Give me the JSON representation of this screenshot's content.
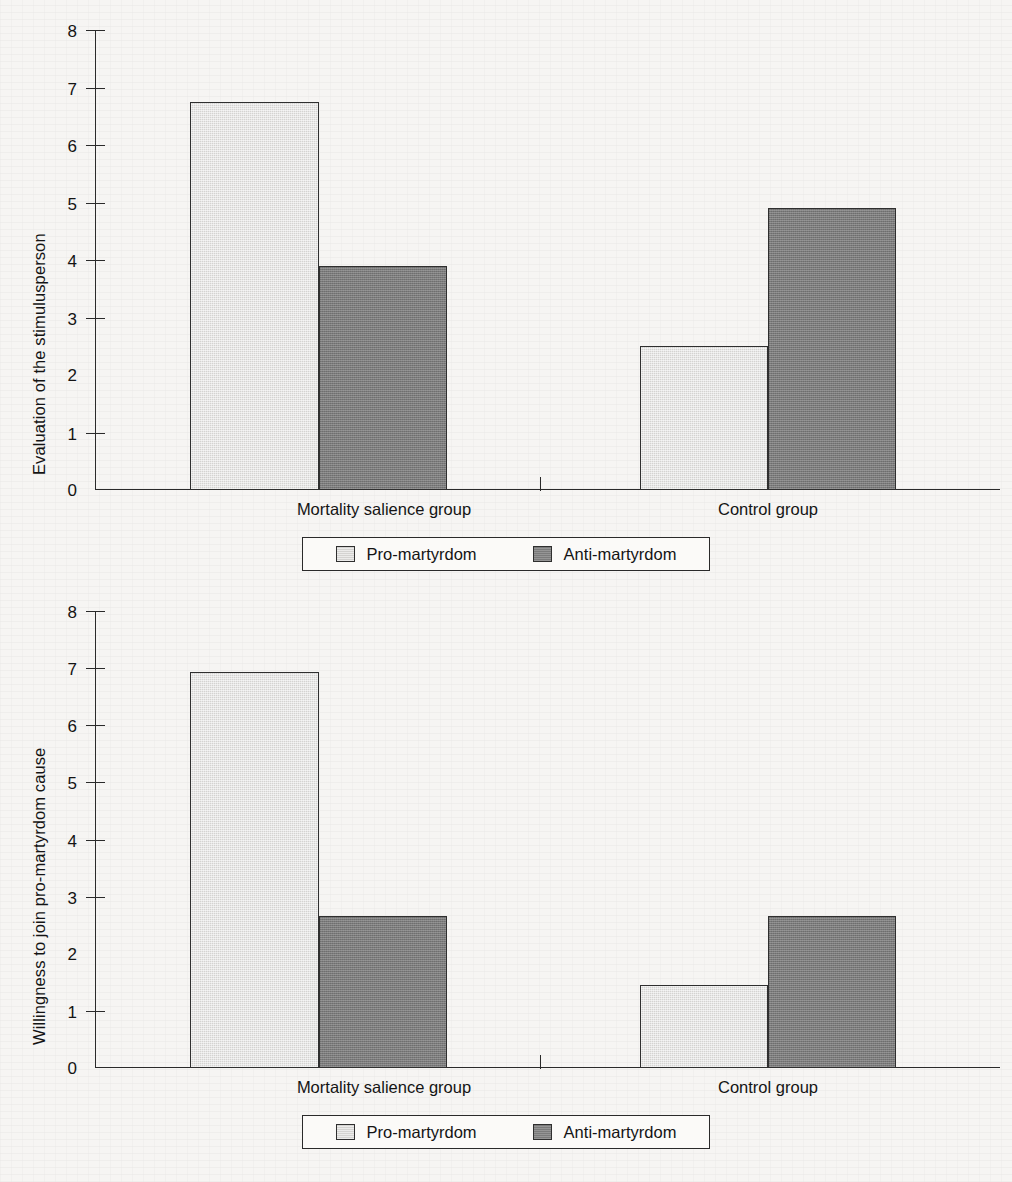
{
  "chart_data": [
    {
      "type": "bar",
      "title": "",
      "xlabel": "",
      "ylabel": "Evaluation of the stimulusperson",
      "categories": [
        "Mortality salience group",
        "Control group"
      ],
      "series": [
        {
          "name": "Pro-martyrdom",
          "values": [
            6.75,
            2.5
          ]
        },
        {
          "name": "Anti-martyrdom",
          "values": [
            3.9,
            4.9
          ]
        }
      ],
      "ylim": [
        0,
        8
      ],
      "yticks": [
        "8",
        "7",
        "6",
        "5",
        "4",
        "3",
        "2",
        "1",
        "0"
      ],
      "grid": false,
      "legend_position": "bottom"
    },
    {
      "type": "bar",
      "title": "",
      "xlabel": "",
      "ylabel": "Willingness to join pro-martyrdom cause",
      "categories": [
        "Mortality salience group",
        "Control group"
      ],
      "series": [
        {
          "name": "Pro-martyrdom",
          "values": [
            6.93,
            1.45
          ]
        },
        {
          "name": "Anti-martyrdom",
          "values": [
            2.67,
            2.67
          ]
        }
      ],
      "ylim": [
        0,
        8
      ],
      "yticks": [
        "8",
        "7",
        "6",
        "5",
        "4",
        "3",
        "2",
        "1",
        "0"
      ],
      "grid": false,
      "legend_position": "bottom"
    }
  ],
  "colors": {
    "pro_martyrdom": "#d4d3d1",
    "anti_martyrdom": "#7b7b7b",
    "axis": "#2a2a2a",
    "background": "#f6f5f3"
  },
  "top_chart": {
    "ylabel": "Evaluation of the stimulusperson",
    "yticks": [
      "8",
      "7",
      "6",
      "5",
      "4",
      "3",
      "2",
      "1",
      "0"
    ],
    "categories": [
      "Mortality salience group",
      "Control group"
    ],
    "legend": [
      {
        "label": "Pro-martyrdom"
      },
      {
        "label": "Anti-martyrdom"
      }
    ]
  },
  "bottom_chart": {
    "ylabel": "Willingness to join pro-martyrdom cause",
    "yticks": [
      "8",
      "7",
      "6",
      "5",
      "4",
      "3",
      "2",
      "1",
      "0"
    ],
    "categories": [
      "Mortality salience group",
      "Control group"
    ],
    "legend": [
      {
        "label": "Pro-martyrdom"
      },
      {
        "label": "Anti-martyrdom"
      }
    ]
  }
}
